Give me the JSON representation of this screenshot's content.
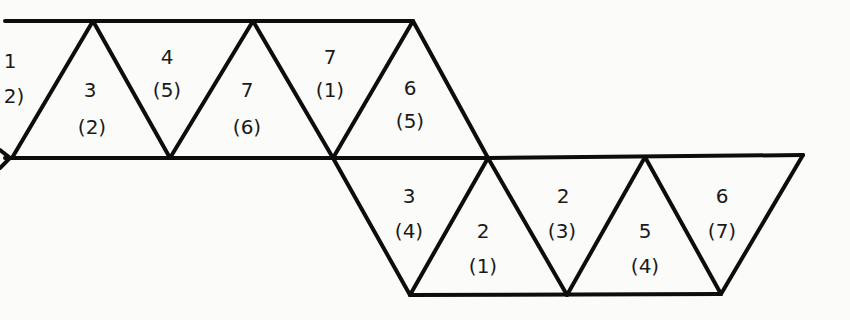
{
  "diagram": {
    "type": "triangle-net",
    "stroke_color": "#0d0d0d",
    "background": "#fbfbf9",
    "edges": [
      [
        5,
        21,
        413,
        21
      ],
      [
        5,
        158,
        488,
        158
      ],
      [
        12,
        158,
        93,
        21
      ],
      [
        93,
        21,
        170,
        158
      ],
      [
        170,
        158,
        253,
        21
      ],
      [
        253,
        21,
        333,
        158
      ],
      [
        333,
        158,
        413,
        21
      ],
      [
        413,
        21,
        488,
        158
      ],
      [
        333,
        158,
        410,
        295
      ],
      [
        488,
        158,
        410,
        295
      ],
      [
        488,
        158,
        567,
        295
      ],
      [
        488,
        158,
        803,
        155
      ],
      [
        567,
        295,
        645,
        157
      ],
      [
        645,
        157,
        721,
        294
      ],
      [
        721,
        294,
        803,
        155
      ],
      [
        410,
        295,
        721,
        294
      ]
    ],
    "faces": [
      {
        "id": "f0",
        "top": "1",
        "bottom": "2)",
        "tx": 10,
        "ty": 68,
        "bx": 14,
        "by": 103
      },
      {
        "id": "f1",
        "top": "3",
        "bottom": "(2)",
        "tx": 90,
        "ty": 97,
        "bx": 92,
        "by": 134
      },
      {
        "id": "f2",
        "top": "4",
        "bottom": "(5)",
        "tx": 167,
        "ty": 64,
        "bx": 167,
        "by": 97
      },
      {
        "id": "f3",
        "top": "7",
        "bottom": "(6)",
        "tx": 247,
        "ty": 97,
        "bx": 247,
        "by": 134
      },
      {
        "id": "f4",
        "top": "7",
        "bottom": "(1)",
        "tx": 330,
        "ty": 64,
        "bx": 330,
        "by": 97
      },
      {
        "id": "f5",
        "top": "6",
        "bottom": "(5)",
        "tx": 410,
        "ty": 95,
        "bx": 410,
        "by": 128
      },
      {
        "id": "f6",
        "top": "3",
        "bottom": "(4)",
        "tx": 409,
        "ty": 203,
        "bx": 409,
        "by": 238
      },
      {
        "id": "f7",
        "top": "2",
        "bottom": "(1)",
        "tx": 483,
        "ty": 238,
        "bx": 483,
        "by": 273
      },
      {
        "id": "f8",
        "top": "2",
        "bottom": "(3)",
        "tx": 563,
        "ty": 203,
        "bx": 562,
        "by": 238
      },
      {
        "id": "f9",
        "top": "5",
        "bottom": "(4)",
        "tx": 645,
        "ty": 238,
        "bx": 645,
        "by": 273
      },
      {
        "id": "f10",
        "top": "6",
        "bottom": "(7)",
        "tx": 722,
        "ty": 203,
        "bx": 722,
        "by": 238
      }
    ]
  }
}
